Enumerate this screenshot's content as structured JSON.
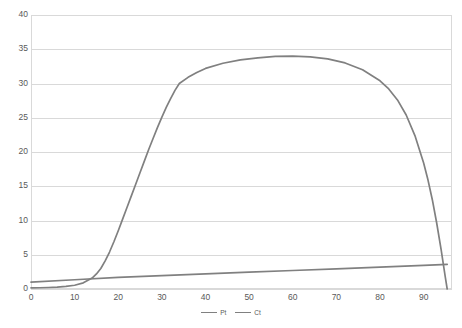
{
  "chart_data": {
    "type": "line",
    "title": "",
    "xlabel": "",
    "ylabel": "",
    "xlim": [
      0,
      96.5
    ],
    "ylim": [
      0,
      40
    ],
    "grid": true,
    "legend_position": "bottom",
    "y_ticks": [
      0,
      5,
      10,
      15,
      20,
      25,
      30,
      35,
      40
    ],
    "x_ticks": [
      0,
      10,
      20,
      30,
      40,
      50,
      60,
      70,
      80,
      90
    ],
    "series": [
      {
        "name": "Pt",
        "color": "#808080",
        "points": [
          [
            0,
            0.15
          ],
          [
            2,
            0.18
          ],
          [
            4,
            0.22
          ],
          [
            6,
            0.28
          ],
          [
            8,
            0.38
          ],
          [
            10,
            0.55
          ],
          [
            12,
            0.9
          ],
          [
            14,
            1.6
          ],
          [
            15,
            2.2
          ],
          [
            16,
            3.0
          ],
          [
            17,
            4.1
          ],
          [
            18,
            5.4
          ],
          [
            19,
            6.9
          ],
          [
            20,
            8.5
          ],
          [
            21,
            10.2
          ],
          [
            22,
            11.9
          ],
          [
            23,
            13.6
          ],
          [
            24,
            15.3
          ],
          [
            25,
            17.0
          ],
          [
            26,
            18.7
          ],
          [
            27,
            20.4
          ],
          [
            28,
            22.0
          ],
          [
            29,
            23.6
          ],
          [
            30,
            25.1
          ],
          [
            31,
            26.5
          ],
          [
            32,
            27.8
          ],
          [
            33,
            29.0
          ],
          [
            34,
            30.0
          ],
          [
            36,
            30.9
          ],
          [
            38,
            31.6
          ],
          [
            40,
            32.2
          ],
          [
            44,
            32.95
          ],
          [
            48,
            33.45
          ],
          [
            52,
            33.75
          ],
          [
            56,
            33.95
          ],
          [
            60,
            34.0
          ],
          [
            64,
            33.9
          ],
          [
            68,
            33.6
          ],
          [
            72,
            33.0
          ],
          [
            76,
            32.0
          ],
          [
            80,
            30.4
          ],
          [
            82,
            29.2
          ],
          [
            84,
            27.6
          ],
          [
            86,
            25.4
          ],
          [
            88,
            22.4
          ],
          [
            90,
            18.4
          ],
          [
            91,
            15.9
          ],
          [
            92,
            13.0
          ],
          [
            93,
            9.6
          ],
          [
            94,
            5.8
          ],
          [
            95,
            1.6
          ],
          [
            95.4,
            0
          ]
        ]
      },
      {
        "name": "Ct",
        "color": "#808080",
        "points": [
          [
            0,
            1.0
          ],
          [
            10,
            1.35
          ],
          [
            20,
            1.7
          ],
          [
            30,
            1.95
          ],
          [
            40,
            2.2
          ],
          [
            50,
            2.45
          ],
          [
            60,
            2.7
          ],
          [
            70,
            2.95
          ],
          [
            80,
            3.2
          ],
          [
            90,
            3.45
          ],
          [
            95.4,
            3.6
          ]
        ]
      }
    ],
    "annotations": {
      "kink_point": [
        34,
        30
      ],
      "peak_point": [
        60,
        34
      ]
    }
  },
  "legend": {
    "entries": [
      {
        "label": "Pt"
      },
      {
        "label": "Ct"
      }
    ]
  }
}
